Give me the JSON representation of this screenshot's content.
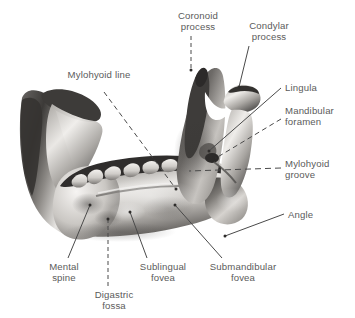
{
  "figure": {
    "background_color": "#ffffff",
    "label_color": "#5b5b5b",
    "leader_color": "#4a4a4a",
    "bone_tone_light": "#f2f0ee",
    "bone_tone_mid": "#b8b5b1",
    "bone_tone_dark": "#4e4c4a"
  },
  "labels": [
    {
      "id": "coronoid-process",
      "text": "Coronoid\nprocess",
      "x": 167,
      "y": 10,
      "w": 62,
      "align": "ctr",
      "leader": "dashed-vertical"
    },
    {
      "id": "condylar-process",
      "text": "Condylar\nprocess",
      "x": 238,
      "y": 20,
      "w": 62,
      "align": "ctr",
      "leader": "solid"
    },
    {
      "id": "mylohyoid-line",
      "text": "Mylohyoid line",
      "x": 56,
      "y": 69,
      "w": 86,
      "align": "ctr",
      "leader": "dashed"
    },
    {
      "id": "lingula",
      "text": "Lingula",
      "x": 285,
      "y": 82,
      "w": 60,
      "align": "lft",
      "leader": "solid"
    },
    {
      "id": "mandibular-foramen",
      "text": "Mandibular\nforamen",
      "x": 285,
      "y": 105,
      "w": 68,
      "align": "lft",
      "leader": "dashed"
    },
    {
      "id": "mylohyoid-groove",
      "text": "Mylohyoid\ngroove",
      "x": 285,
      "y": 158,
      "w": 64,
      "align": "lft",
      "leader": "dashed-horizontal"
    },
    {
      "id": "angle",
      "text": "Angle",
      "x": 288,
      "y": 209,
      "w": 50,
      "align": "lft",
      "leader": "solid"
    },
    {
      "id": "mental-spine",
      "text": "Mental\nspine",
      "x": 38,
      "y": 261,
      "w": 52,
      "align": "ctr",
      "leader": "solid"
    },
    {
      "id": "digastric-fossa",
      "text": "Digastric\nfossa",
      "x": 83,
      "y": 289,
      "w": 62,
      "align": "ctr",
      "leader": "dashed-vertical"
    },
    {
      "id": "sublingual-fovea",
      "text": "Sublingual\nfovea",
      "x": 129,
      "y": 261,
      "w": 68,
      "align": "ctr",
      "leader": "solid"
    },
    {
      "id": "submandibular-fovea",
      "text": "Submandibular\nfovea",
      "x": 198,
      "y": 261,
      "w": 90,
      "align": "ctr",
      "leader": "solid"
    }
  ]
}
